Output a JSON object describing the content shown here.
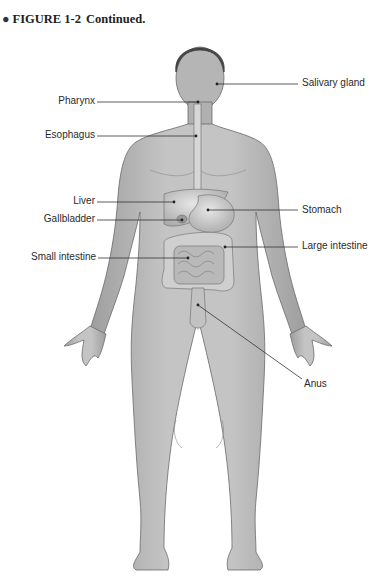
{
  "figure": {
    "bullet": "●",
    "number": "FIGURE 1-2",
    "caption": "Continued."
  },
  "labels": {
    "salivary_gland": "Salivary gland",
    "pharynx": "Pharynx",
    "esophagus": "Esophagus",
    "liver": "Liver",
    "gallbladder": "Gallbladder",
    "stomach": "Stomach",
    "small_intestine": "Small intestine",
    "large_intestine": "Large intestine",
    "anus": "Anus"
  },
  "colors": {
    "skin": "#b8b8b8",
    "skin_light": "#d2d2d2",
    "outline": "#6a6a6a",
    "organ": "#cfcfcf",
    "leader_line": "#333333"
  }
}
